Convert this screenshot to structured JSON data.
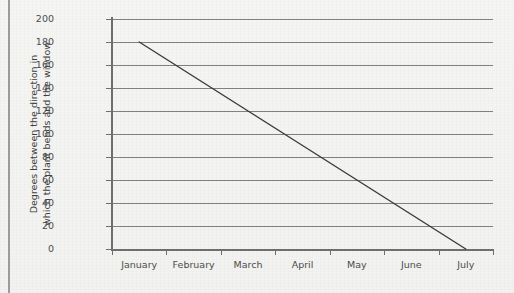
{
  "chart_data": {
    "type": "line",
    "title": "",
    "xlabel": "",
    "ylabel": "Degrees between the direction in which the plant bends and the window",
    "ylabel_lines": [
      "Degrees between the direction in",
      "which the plant bends and the window"
    ],
    "categories": [
      "January",
      "February",
      "March",
      "April",
      "May",
      "June",
      "July"
    ],
    "x": [
      0,
      1,
      2,
      3,
      4,
      5,
      6
    ],
    "values": [
      180,
      150,
      120,
      90,
      60,
      30,
      0
    ],
    "series": [
      {
        "name": "Degrees of bend",
        "values": [
          180,
          150,
          120,
          90,
          60,
          30,
          0
        ]
      }
    ],
    "ylim": [
      0,
      200
    ],
    "y_ticks": [
      0,
      20,
      40,
      60,
      80,
      100,
      120,
      140,
      160,
      180,
      200
    ],
    "y_tick_labels": [
      "0",
      "20",
      "40",
      "60",
      "80",
      "100",
      "120",
      "140",
      "160",
      "180",
      "200"
    ],
    "grid": "horizontal",
    "gridline_values": [
      20,
      40,
      60,
      80,
      100,
      120,
      140,
      160,
      180,
      200
    ],
    "legend": "none",
    "legend_position": "none",
    "line_color": "#3a3a3a",
    "grid_color": "#808080",
    "axis_color": "#6e6e6e",
    "background_color": "#f4f4f2",
    "markers": "none"
  },
  "figure": {
    "page_rule_color": "#9b9b9b"
  }
}
